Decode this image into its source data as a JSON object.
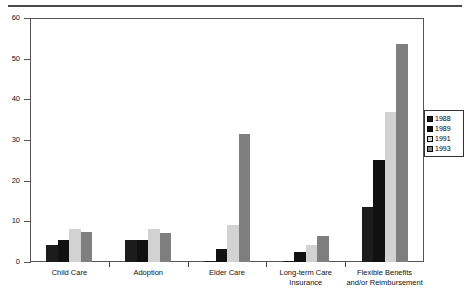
{
  "chart_data": {
    "type": "bar",
    "title": "",
    "xlabel": "",
    "ylabel": "Percent",
    "ylim": [
      0,
      60
    ],
    "yticks": [
      0,
      10,
      20,
      30,
      40,
      50,
      60
    ],
    "grid": false,
    "legend_position": "right",
    "categories": [
      "Child Care",
      "Adoption",
      "Elder Care",
      "Long-term Care Insurance",
      "Flexible Benefits and/or Reimbursement"
    ],
    "category_labels": [
      [
        "Child Care"
      ],
      [
        "Adoption"
      ],
      [
        "Elder Care"
      ],
      [
        "Long-term Care",
        "Insurance"
      ],
      [
        "Flexible Benefits",
        "and/or Reimbursement"
      ]
    ],
    "series": [
      {
        "name": "1988",
        "color": "#1c1c1c",
        "values": [
          4.2,
          5.3,
          0.3,
          0.3,
          13.5
        ]
      },
      {
        "name": "1989",
        "color": "#111111",
        "values": [
          5.4,
          5.4,
          3.2,
          2.5,
          25.0
        ]
      },
      {
        "name": "1991",
        "color": "#d2d2d2",
        "values": [
          8.1,
          8.0,
          9.0,
          4.1,
          37.0
        ]
      },
      {
        "name": "1993",
        "color": "#7f7f7f",
        "values": [
          7.3,
          7.2,
          31.5,
          6.5,
          53.5
        ]
      }
    ]
  },
  "legend": {
    "items": [
      {
        "label": "1988"
      },
      {
        "label": "1989"
      },
      {
        "label": "1991"
      },
      {
        "label": "1993"
      }
    ]
  },
  "axis": {
    "y_label": "Percent",
    "y_tick_labels": [
      "0",
      "10",
      "20",
      "30",
      "40",
      "50",
      "60"
    ]
  }
}
